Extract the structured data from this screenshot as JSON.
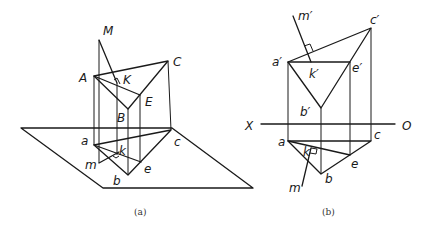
{
  "figure_a": {
    "caption": "(a)",
    "labels": {
      "M": "M",
      "A": "A",
      "C": "C",
      "K": "K",
      "E": "E",
      "B": "B",
      "a": "a",
      "c": "c",
      "k": "k",
      "m": "m",
      "e": "e",
      "b": "b"
    }
  },
  "figure_b": {
    "caption": "(b)",
    "labels": {
      "m_prime": "m′",
      "c_prime": "c′",
      "a_prime": "a′",
      "k_prime": "k′",
      "e_prime": "e′",
      "b_prime": "b′",
      "X": "X",
      "O": "O",
      "a": "a",
      "c": "c",
      "k": "k",
      "e": "e",
      "b": "b",
      "m": "m"
    }
  },
  "colors": {
    "line": "#1a1a1a",
    "background": "#ffffff"
  }
}
